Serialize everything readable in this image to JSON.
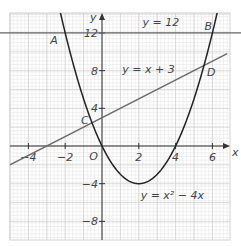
{
  "chart_data": {
    "type": "line",
    "title": "",
    "xlabel": "x",
    "ylabel": "y",
    "xlim": [
      -5,
      6.8
    ],
    "ylim": [
      -10,
      14
    ],
    "grid": true,
    "x_ticks": [
      -4,
      -2,
      2,
      4,
      6
    ],
    "y_ticks": [
      -8,
      -4,
      4,
      8,
      12
    ],
    "x_tick_labels": [
      "−4",
      "−2",
      "2",
      "4",
      "6"
    ],
    "y_tick_labels": [
      "−8",
      "−4",
      "4",
      "8",
      "12"
    ],
    "origin_label": "O",
    "series": [
      {
        "name": "y = x² − 4x",
        "kind": "parabola",
        "equation": "y = x^2 - 4x",
        "x": [
          -2.6,
          -2,
          -1,
          0,
          1,
          2,
          3,
          4,
          5,
          6,
          6.6
        ],
        "y": [
          17.2,
          12,
          5,
          0,
          -3,
          -4,
          -3,
          0,
          5,
          12,
          17.2
        ],
        "color": "#222222"
      },
      {
        "name": "y = x + 3",
        "kind": "line",
        "equation": "y = x + 3",
        "x": [
          -5,
          6.8
        ],
        "y": [
          -2,
          9.8
        ],
        "color": "#666666"
      },
      {
        "name": "y = 12",
        "kind": "line",
        "equation": "y = 12",
        "x": [
          -5,
          6.8
        ],
        "y": [
          12,
          12
        ],
        "color": "#666666"
      }
    ],
    "points": [
      {
        "label": "A",
        "x": -2,
        "y": 12
      },
      {
        "label": "B",
        "x": 6,
        "y": 12
      },
      {
        "label": "C",
        "x": -0.54,
        "y": 2.46
      },
      {
        "label": "D",
        "x": 5.54,
        "y": 8.54
      }
    ],
    "annotations": [
      {
        "text": "y = 12",
        "x": 2.2,
        "y": 12.7
      },
      {
        "text": "y = x + 3",
        "x": 1.1,
        "y": 7.8
      },
      {
        "text": "y = x² − 4x",
        "x": 2.1,
        "y": -5.6
      }
    ]
  }
}
